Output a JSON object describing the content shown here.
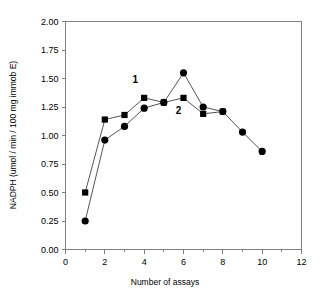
{
  "chart_data": {
    "type": "line",
    "title": "",
    "xlabel": "Number of assays",
    "ylabel": "NADPH (umol / min / 100 mg immob E)",
    "xlim": [
      0,
      12
    ],
    "ylim": [
      0.0,
      2.0
    ],
    "grid": false,
    "legend": "inline-labels",
    "x_ticks": [
      "0",
      "2",
      "4",
      "6",
      "8",
      "10",
      "12"
    ],
    "x_tick_values": [
      0,
      2,
      4,
      6,
      8,
      10,
      12
    ],
    "x_minor_tick_values": [
      1,
      3,
      5,
      7,
      9,
      11
    ],
    "y_ticks": [
      "0.00",
      "0.25",
      "0.50",
      "0.75",
      "1.00",
      "1.25",
      "1.50",
      "1.75",
      "2.00"
    ],
    "y_tick_values": [
      0.0,
      0.25,
      0.5,
      0.75,
      1.0,
      1.25,
      1.5,
      1.75,
      2.0
    ],
    "series": [
      {
        "name": "1",
        "marker": "square",
        "label": "1",
        "label_x": 3.55,
        "label_y": 1.46,
        "x": [
          1,
          2,
          3,
          4,
          5,
          6,
          7,
          8
        ],
        "values": [
          0.5,
          1.14,
          1.18,
          1.33,
          1.29,
          1.33,
          1.19,
          1.21
        ]
      },
      {
        "name": "2",
        "marker": "circle",
        "label": "2",
        "label_x": 5.75,
        "label_y": 1.19,
        "x": [
          1,
          2,
          3,
          4,
          5,
          6,
          7,
          8,
          9,
          10
        ],
        "values": [
          0.25,
          0.96,
          1.08,
          1.24,
          1.29,
          1.55,
          1.25,
          1.21,
          1.03,
          0.86
        ]
      }
    ]
  },
  "colors": {
    "marker": "#000000",
    "line": "#555555",
    "axis": "#808080",
    "background": "#ffffff"
  }
}
